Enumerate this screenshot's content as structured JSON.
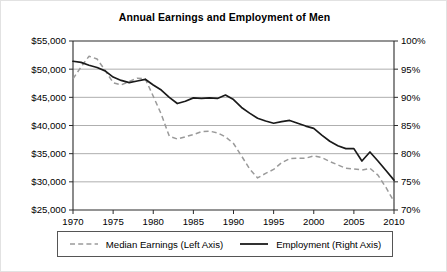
{
  "chart_data": {
    "type": "line",
    "title": "Annual Earnings and Employment of Men",
    "xlabel": "",
    "ylabel": "",
    "grid": true,
    "legend_position": "bottom",
    "x": [
      1970,
      1971,
      1972,
      1973,
      1974,
      1975,
      1976,
      1977,
      1978,
      1979,
      1980,
      1981,
      1982,
      1983,
      1984,
      1985,
      1986,
      1987,
      1988,
      1989,
      1990,
      1991,
      1992,
      1993,
      1994,
      1995,
      1996,
      1997,
      1998,
      1999,
      2000,
      2001,
      2002,
      2003,
      2004,
      2005,
      2006,
      2007,
      2008,
      2009,
      2010
    ],
    "xlim": [
      1970,
      2010
    ],
    "xticks": [
      1970,
      1975,
      1980,
      1985,
      1990,
      1995,
      2000,
      2005,
      2010
    ],
    "xticklabels": [
      "1970",
      "1975",
      "1980",
      "1985",
      "1990",
      "1995",
      "2000",
      "2005",
      "2010"
    ],
    "left_axis": {
      "label": "Median Earnings",
      "ylim": [
        25000,
        55000
      ],
      "yticks": [
        25000,
        30000,
        35000,
        40000,
        45000,
        50000,
        55000
      ],
      "yticklabels": [
        "$25,000",
        "$30,000",
        "$35,000",
        "$40,000",
        "$45,000",
        "$50,000",
        "$55,000"
      ]
    },
    "right_axis": {
      "label": "Employment",
      "ylim": [
        70,
        100
      ],
      "yticks": [
        70,
        75,
        80,
        85,
        90,
        95,
        100
      ],
      "yticklabels": [
        "70%",
        "75%",
        "80%",
        "85%",
        "90%",
        "95%",
        "100%"
      ]
    },
    "series": [
      {
        "name": "Median Earnings (Left Axis)",
        "axis": "left",
        "style": "dashed",
        "color": "#9a9a9a",
        "values": [
          48300,
          50400,
          52300,
          51800,
          49800,
          47600,
          47200,
          47800,
          48400,
          48300,
          45200,
          42000,
          38100,
          37600,
          38000,
          38400,
          38900,
          39000,
          38700,
          38000,
          36800,
          34600,
          32300,
          30700,
          31500,
          32200,
          33400,
          34100,
          34200,
          34200,
          34600,
          34300,
          33600,
          33000,
          32400,
          32300,
          32100,
          32400,
          31200,
          29000,
          26500
        ]
      },
      {
        "name": "Employment (Right Axis)",
        "axis": "right",
        "style": "solid",
        "color": "#1a1a1a",
        "values": [
          96.4,
          96.2,
          95.7,
          95.3,
          94.7,
          93.6,
          93.0,
          92.6,
          92.9,
          93.2,
          92.2,
          91.3,
          90.0,
          88.9,
          89.3,
          89.9,
          89.8,
          89.9,
          89.8,
          90.4,
          89.6,
          88.2,
          87.2,
          86.3,
          85.8,
          85.4,
          85.7,
          85.9,
          85.4,
          84.9,
          84.5,
          83.3,
          82.2,
          81.4,
          80.9,
          80.9,
          78.7,
          80.3,
          78.7,
          77.0,
          75.3
        ]
      }
    ]
  },
  "legend": {
    "entries": [
      {
        "label": "Median Earnings (Left Axis)",
        "style": "dashed",
        "color": "#9a9a9a"
      },
      {
        "label": "Employment (Right Axis)",
        "style": "solid",
        "color": "#1a1a1a"
      }
    ]
  }
}
